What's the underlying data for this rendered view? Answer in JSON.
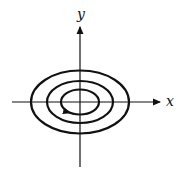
{
  "diagram": {
    "type": "phase-portrait",
    "axes": {
      "x_label": "x",
      "y_label": "y"
    },
    "orbits": [
      {
        "name": "inner",
        "rx": 19,
        "ry": 12
      },
      {
        "name": "middle",
        "rx": 33,
        "ry": 21
      },
      {
        "name": "outer",
        "rx": 49,
        "ry": 32
      }
    ],
    "direction_arrow": {
      "orbit": "inner",
      "position": "lower-left",
      "direction": "counterclockwise toward bottom"
    },
    "colors": {
      "stroke": "#111111",
      "background": "#ffffff"
    }
  }
}
